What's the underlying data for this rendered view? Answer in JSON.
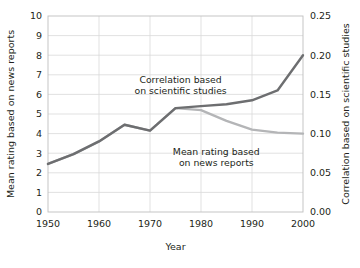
{
  "chart_data": {
    "type": "line",
    "title": "",
    "xlabel": "Year",
    "ylabel": "Mean rating based on news reports",
    "y2label": "Correlation based on scientific studies",
    "xlim": [
      1950,
      2000
    ],
    "ylim": [
      0,
      10
    ],
    "y2lim": [
      0.0,
      0.25
    ],
    "grid": true,
    "legend_position": "inline-annotations",
    "xticks": [
      "1950",
      "1960",
      "1970",
      "1980",
      "1990",
      "2000"
    ],
    "xtick_values": [
      1950,
      1960,
      1970,
      1980,
      1990,
      2000
    ],
    "yticks": [
      "0",
      "1",
      "2",
      "3",
      "4",
      "5",
      "6",
      "7",
      "8",
      "9",
      "10"
    ],
    "ytick_values": [
      0,
      1,
      2,
      3,
      4,
      5,
      6,
      7,
      8,
      9,
      10
    ],
    "y2ticks": [
      "0.00",
      "0.05",
      "0.10",
      "0.15",
      "0.20",
      "0.25"
    ],
    "y2tick_values": [
      0.0,
      0.05,
      0.1,
      0.15,
      0.2,
      0.25
    ],
    "x": [
      1950,
      1955,
      1960,
      1965,
      1970,
      1975,
      1980,
      1985,
      1990,
      1995,
      2000
    ],
    "series": [
      {
        "name": "Correlation based on scientific studies",
        "axis": "right",
        "color": "#6d6e70",
        "values_left_scale": [
          2.45,
          2.95,
          3.6,
          4.45,
          4.15,
          5.3,
          5.4,
          5.5,
          5.7,
          6.2,
          8.0
        ],
        "values": [
          0.061,
          0.074,
          0.09,
          0.111,
          0.104,
          0.133,
          0.135,
          0.138,
          0.143,
          0.155,
          0.2
        ]
      },
      {
        "name": "Mean rating based on news reports",
        "axis": "left",
        "color": "#b4b5b7",
        "values": [
          2.45,
          2.95,
          3.6,
          4.45,
          4.15,
          5.3,
          5.2,
          4.65,
          4.2,
          4.05,
          4.0
        ]
      }
    ],
    "annotations": [
      {
        "id": "annotation-scientific",
        "lines": [
          "Correlation based",
          "on scientific studies"
        ],
        "x": 1976,
        "y_left_scale": 6.6
      },
      {
        "id": "annotation-news",
        "lines": [
          "Mean rating based",
          "on news reports"
        ],
        "x": 1983,
        "y_left_scale": 2.9
      }
    ]
  },
  "axes": {
    "x_title": "Year",
    "y_left_title": "Mean rating based on news reports",
    "y_right_title": "Correlation based on scientific studies"
  }
}
